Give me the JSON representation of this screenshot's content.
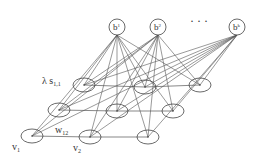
{
  "diagram": {
    "type": "graphical-model",
    "colors": {
      "stroke": "#444444",
      "edge": "#555555",
      "background": "#ffffff"
    },
    "hidden_nodes": [
      {
        "id": "b1",
        "label": "b",
        "sup": "1",
        "x": 117,
        "y": 27
      },
      {
        "id": "b2",
        "label": "b",
        "sup": "2",
        "x": 158,
        "y": 27
      },
      {
        "id": "bk",
        "label": "b",
        "sup": "k",
        "x": 237,
        "y": 27
      }
    ],
    "ellipsis": "· · ·",
    "grid_rows": [
      [
        {
          "id": "n31",
          "x": 84,
          "y": 85
        },
        {
          "id": "n32",
          "x": 145,
          "y": 87
        },
        {
          "id": "n33",
          "x": 200,
          "y": 85
        }
      ],
      [
        {
          "id": "n21",
          "x": 59,
          "y": 110
        },
        {
          "id": "n22",
          "x": 117,
          "y": 111
        },
        {
          "id": "n23",
          "x": 173,
          "y": 111
        }
      ],
      [
        {
          "id": "v1",
          "x": 32,
          "y": 136
        },
        {
          "id": "v2",
          "x": 90,
          "y": 137
        },
        {
          "id": "n13",
          "x": 148,
          "y": 137
        }
      ]
    ],
    "labels": {
      "lambda_s": {
        "main": "λ s",
        "sub": "1,1"
      },
      "w12": {
        "main": "w",
        "sub": "12"
      },
      "v1": {
        "main": "v",
        "sub": "1"
      },
      "v2": {
        "main": "v",
        "sub": "2"
      }
    }
  }
}
